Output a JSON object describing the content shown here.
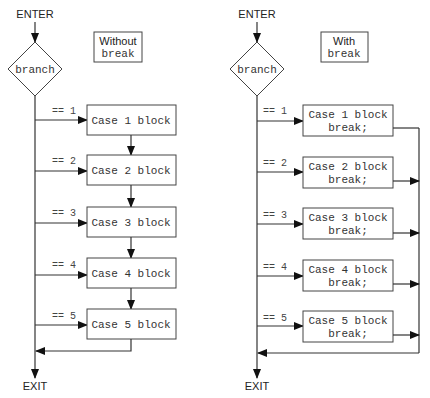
{
  "figure": {
    "left": {
      "title_line1": "Without",
      "title_line2": "break",
      "enter": "ENTER",
      "branch": "branch",
      "exit": "EXIT",
      "cases": [
        {
          "cond": "== 1",
          "line1": "Case 1 block"
        },
        {
          "cond": "== 2",
          "line1": "Case 2 block"
        },
        {
          "cond": "== 3",
          "line1": "Case 3 block"
        },
        {
          "cond": "== 4",
          "line1": "Case 4 block"
        },
        {
          "cond": "== 5",
          "line1": "Case 5 block"
        }
      ]
    },
    "right": {
      "title_line1": "With",
      "title_line2": "break",
      "enter": "ENTER",
      "branch": "branch",
      "exit": "EXIT",
      "cases": [
        {
          "cond": "== 1",
          "line1": "Case 1 block",
          "line2": "break;"
        },
        {
          "cond": "== 2",
          "line1": "Case 2 block",
          "line2": "break;"
        },
        {
          "cond": "== 3",
          "line1": "Case 3 block",
          "line2": "break;"
        },
        {
          "cond": "== 4",
          "line1": "Case 4 block",
          "line2": "break;"
        },
        {
          "cond": "== 5",
          "line1": "Case 5 block",
          "line2": "break;"
        }
      ]
    }
  }
}
